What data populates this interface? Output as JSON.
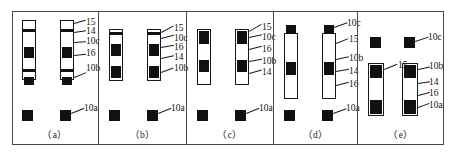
{
  "figure": {
    "title": "",
    "panel_count": 5,
    "background_color": "#ffffff",
    "line_color": "#1a1a1a",
    "fill_color": "#111111"
  },
  "panels": [
    {
      "id": "a",
      "caption": "（a）",
      "labels": [
        {
          "key": "l_a_15",
          "text": "15"
        },
        {
          "key": "l_a_14",
          "text": "14"
        },
        {
          "key": "l_a_10c",
          "text": "10c"
        },
        {
          "key": "l_a_16",
          "text": "16"
        },
        {
          "key": "l_a_10b",
          "text": "10b"
        },
        {
          "key": "l_a_10a",
          "text": "10a"
        }
      ]
    },
    {
      "id": "b",
      "caption": "（b）",
      "labels": [
        {
          "key": "l_b_15",
          "text": "15"
        },
        {
          "key": "l_b_10c",
          "text": "10c"
        },
        {
          "key": "l_b_16",
          "text": "16"
        },
        {
          "key": "l_b_14",
          "text": "14"
        },
        {
          "key": "l_b_10b",
          "text": "10b"
        },
        {
          "key": "l_b_10a",
          "text": "10a"
        }
      ]
    },
    {
      "id": "c",
      "caption": "（c）",
      "labels": [
        {
          "key": "l_c_15",
          "text": "15"
        },
        {
          "key": "l_c_10c",
          "text": "10c"
        },
        {
          "key": "l_c_16",
          "text": "16"
        },
        {
          "key": "l_c_10b",
          "text": "10b"
        },
        {
          "key": "l_c_14",
          "text": "14"
        },
        {
          "key": "l_c_10a",
          "text": "10a"
        }
      ]
    },
    {
      "id": "d",
      "caption": "（d）",
      "labels": [
        {
          "key": "l_d_10c",
          "text": "10c"
        },
        {
          "key": "l_d_15",
          "text": "15"
        },
        {
          "key": "l_d_10b",
          "text": "10b"
        },
        {
          "key": "l_d_14",
          "text": "14"
        },
        {
          "key": "l_d_16",
          "text": "16"
        },
        {
          "key": "l_d_10a",
          "text": "10a"
        }
      ]
    },
    {
      "id": "e",
      "caption": "（e）",
      "labels": [
        {
          "key": "l_e_10c",
          "text": "10c"
        },
        {
          "key": "l_e_15",
          "text": "15"
        },
        {
          "key": "l_e_10b",
          "text": "10b"
        },
        {
          "key": "l_e_14",
          "text": "14"
        },
        {
          "key": "l_e_16",
          "text": "16"
        },
        {
          "key": "l_e_10a",
          "text": "10a"
        }
      ]
    }
  ]
}
